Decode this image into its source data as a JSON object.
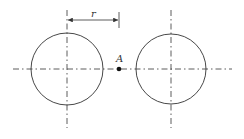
{
  "diagram": {
    "labels": {
      "dimension": "r",
      "point": "A"
    },
    "colors": {
      "stroke": "#333333",
      "background": "#ffffff"
    },
    "elements": {
      "left_circle": {
        "cx": 67,
        "cy": 69,
        "r": 36
      },
      "right_circle": {
        "cx": 171,
        "cy": 69,
        "r": 35
      },
      "point_A": {
        "x": 119,
        "y": 69
      }
    }
  }
}
